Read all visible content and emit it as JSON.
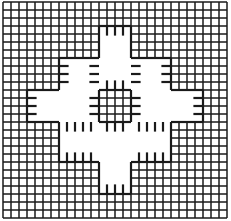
{
  "diagram": {
    "type": "grid-pattern",
    "grid": {
      "x0": 3,
      "y0": 2,
      "cell": 8,
      "cols": 28,
      "rows": 27,
      "stroke": "#1a1a1a",
      "stroke_width": 1.5
    },
    "motif": {
      "center_square": [
        12,
        11,
        16,
        15
      ],
      "arm_half_width": 2,
      "white_regions": [
        [
          12,
          3,
          16,
          11
        ],
        [
          12,
          15,
          16,
          24
        ],
        [
          3,
          11,
          12,
          15
        ],
        [
          16,
          11,
          25,
          15
        ],
        [
          7,
          7,
          12,
          11
        ],
        [
          16,
          7,
          21,
          11
        ],
        [
          7,
          15,
          12,
          20
        ],
        [
          16,
          15,
          21,
          20
        ]
      ],
      "heavy_stroke_width": 2.2
    }
  }
}
